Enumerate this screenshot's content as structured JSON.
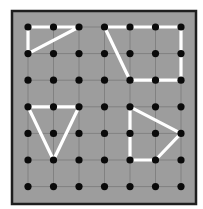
{
  "geoboard": {
    "columns": 7,
    "rows": 7,
    "colors": {
      "background": "#ffffff",
      "board": "#9d9d9d",
      "border": "#1e1e1e",
      "grid_line": "#6f6f6f",
      "peg": "#0a0a0a",
      "band": "#ffffff"
    },
    "shapes": [
      {
        "name": "top-left-triangle",
        "points": [
          [
            0,
            0
          ],
          [
            2,
            0
          ],
          [
            0,
            1
          ]
        ]
      },
      {
        "name": "top-right-quadrilateral",
        "points": [
          [
            3,
            0
          ],
          [
            6,
            0
          ],
          [
            6,
            2
          ],
          [
            4,
            2
          ]
        ]
      },
      {
        "name": "left-triangle",
        "points": [
          [
            0,
            3
          ],
          [
            2,
            3
          ],
          [
            1,
            5
          ]
        ]
      },
      {
        "name": "bottom-right-quadrilateral",
        "points": [
          [
            4,
            3
          ],
          [
            6,
            4
          ],
          [
            5,
            5
          ],
          [
            4,
            5
          ]
        ]
      }
    ]
  }
}
